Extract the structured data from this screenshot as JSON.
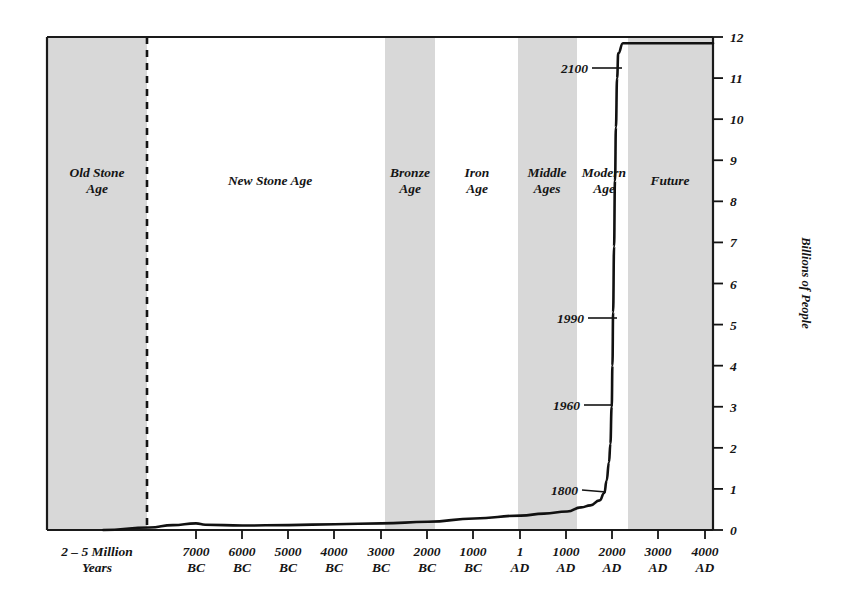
{
  "chart_data": {
    "type": "line",
    "title": "",
    "xlabel": "",
    "ylabel": "Billions of People",
    "ylim": [
      0,
      12
    ],
    "yticks": [
      0,
      1,
      2,
      3,
      4,
      5,
      6,
      7,
      8,
      9,
      10,
      11,
      12
    ],
    "ytick_labels": [
      "0",
      "1",
      "2",
      "3",
      "4",
      "5",
      "6",
      "7",
      "8",
      "9",
      "10",
      "11",
      "12"
    ],
    "grid": false,
    "legend": "none",
    "xtick_labels": [
      {
        "line1": "2 – 5 Million",
        "line2": "Years"
      },
      {
        "line1": "7000",
        "line2": "BC"
      },
      {
        "line1": "6000",
        "line2": "BC"
      },
      {
        "line1": "5000",
        "line2": "BC"
      },
      {
        "line1": "4000",
        "line2": "BC"
      },
      {
        "line1": "3000",
        "line2": "BC"
      },
      {
        "line1": "2000",
        "line2": "BC"
      },
      {
        "line1": "1000",
        "line2": "BC"
      },
      {
        "line1": "1",
        "line2": "AD"
      },
      {
        "line1": "1000",
        "line2": "AD"
      },
      {
        "line1": "2000",
        "line2": "AD"
      },
      {
        "line1": "3000",
        "line2": "AD"
      },
      {
        "line1": "4000",
        "line2": "AD"
      }
    ],
    "eras": [
      {
        "name": "Old Stone Age",
        "line1": "Old Stone",
        "line2": "Age",
        "shaded": true
      },
      {
        "name": "New Stone Age",
        "line1": "New Stone Age",
        "line2": "",
        "shaded": false
      },
      {
        "name": "Bronze Age",
        "line1": "Bronze",
        "line2": "Age",
        "shaded": true
      },
      {
        "name": "Iron Age",
        "line1": "Iron",
        "line2": "Age",
        "shaded": false
      },
      {
        "name": "Middle Ages",
        "line1": "Middle",
        "line2": "Ages",
        "shaded": true
      },
      {
        "name": "Modern Age",
        "line1": "Modern",
        "line2": "Age",
        "shaded": false
      },
      {
        "name": "Future",
        "line1": "Future",
        "line2": "",
        "shaded": true
      }
    ],
    "annotations": [
      {
        "label": "1800",
        "year": 1800,
        "population": 0.9
      },
      {
        "label": "1960",
        "year": 1960,
        "population": 3.0
      },
      {
        "label": "1990",
        "year": 1990,
        "population": 5.3
      },
      {
        "label": "2100",
        "year": 2100,
        "population": 11.6
      }
    ],
    "series": [
      {
        "name": "World Population",
        "points": [
          {
            "year": -9000,
            "population": 0.0
          },
          {
            "year": -8000,
            "population": 0.06
          },
          {
            "year": -7500,
            "population": 0.12
          },
          {
            "year": -7000,
            "population": 0.16
          },
          {
            "year": -6800,
            "population": 0.13
          },
          {
            "year": -6000,
            "population": 0.11
          },
          {
            "year": -5000,
            "population": 0.12
          },
          {
            "year": -4000,
            "population": 0.14
          },
          {
            "year": -3000,
            "population": 0.16
          },
          {
            "year": -2000,
            "population": 0.2
          },
          {
            "year": -1000,
            "population": 0.28
          },
          {
            "year": 1,
            "population": 0.35
          },
          {
            "year": 500,
            "population": 0.4
          },
          {
            "year": 1000,
            "population": 0.45
          },
          {
            "year": 1300,
            "population": 0.55
          },
          {
            "year": 1500,
            "population": 0.6
          },
          {
            "year": 1700,
            "population": 0.72
          },
          {
            "year": 1800,
            "population": 0.9
          },
          {
            "year": 1850,
            "population": 1.2
          },
          {
            "year": 1900,
            "population": 1.65
          },
          {
            "year": 1930,
            "population": 2.1
          },
          {
            "year": 1960,
            "population": 3.0
          },
          {
            "year": 1975,
            "population": 4.0
          },
          {
            "year": 1990,
            "population": 5.3
          },
          {
            "year": 2010,
            "population": 6.9
          },
          {
            "year": 2030,
            "population": 8.5
          },
          {
            "year": 2050,
            "population": 9.8
          },
          {
            "year": 2075,
            "population": 11.0
          },
          {
            "year": 2100,
            "population": 11.6
          },
          {
            "year": 2200,
            "population": 11.85
          },
          {
            "year": 2500,
            "population": 11.85
          },
          {
            "year": 4500,
            "population": 11.85
          }
        ]
      }
    ]
  },
  "colors": {
    "band_shade": "#d8d8d8",
    "axis": "#1a1a1a",
    "curve": "#111111",
    "background": "#ffffff"
  }
}
